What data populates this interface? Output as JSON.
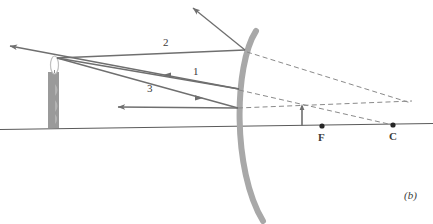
{
  "figure": {
    "panel_label": "(b)",
    "type": "ray-diagram-concave-mirror",
    "colors": {
      "mirror": "#a8a8a8",
      "ray": "#6f6f6f",
      "dashed": "#8a8a8a",
      "axis": "#5a5a5a",
      "candle_body": "#9a9a9a",
      "candle_flame": "#c9c9c9",
      "image_arrow": "#6f6f6f",
      "text": "#3b3b3b"
    },
    "ray_labels": [
      {
        "id": "ray-1",
        "text": "1",
        "x": 193,
        "y": 72
      },
      {
        "id": "ray-2",
        "text": "2",
        "x": 163,
        "y": 43
      },
      {
        "id": "ray-3",
        "text": "3",
        "x": 147,
        "y": 89
      }
    ],
    "point_labels": [
      {
        "id": "focal-point",
        "text": "F",
        "x": 318,
        "y": 132
      },
      {
        "id": "center-of-curvature",
        "text": "C",
        "x": 389,
        "y": 131
      }
    ],
    "points": [
      {
        "id": "F",
        "cx": 322,
        "cy": 126,
        "r": 2.6
      },
      {
        "id": "C",
        "cx": 393,
        "cy": 125,
        "r": 2.6
      }
    ],
    "axis": {
      "x1": 0,
      "y1": 129.5,
      "x2": 433,
      "y2": 123.5
    },
    "mirror": {
      "path": "M 256 31 C 234 65 232 170 263 221",
      "stroke_width": 6
    },
    "object": {
      "name": "candle",
      "body": {
        "x": 48,
        "y": 72,
        "w": 11,
        "h": 56
      },
      "flame_tip": {
        "x": 57,
        "y": 58
      }
    },
    "image": {
      "name": "inverted-image-arrow",
      "x": 302,
      "y_top": 106,
      "y_bottom": 126
    },
    "solid_rays": [
      {
        "id": "incident-ray-2",
        "d": "M 57 58 L 245 50"
      },
      {
        "id": "reflected-ray-2",
        "d": "M 245 50 L 191 6"
      },
      {
        "id": "incident-ray-1",
        "d": "M 57 58 L 239 89"
      },
      {
        "id": "reflected-ray-1",
        "d": "M 239 89 L 58 60"
      },
      {
        "id": "incident-ray-3",
        "d": "M 57 58 L 238 108"
      },
      {
        "id": "reflected-ray-3",
        "d": "M 238 108 L 116 107"
      }
    ],
    "dashed_rays": [
      {
        "id": "virtual-extension-a",
        "d": "M 247 52 L 411 103"
      },
      {
        "id": "virtual-extension-b",
        "d": "M 238 108 L 412 101"
      },
      {
        "id": "virtual-extension-c",
        "d": "M 239 90 L 393 125"
      }
    ],
    "arrowheads": [
      {
        "id": "arrowhead-reflected-2",
        "x": 191,
        "y": 6,
        "angle": 219
      },
      {
        "id": "arrowhead-reflected-1-far",
        "x": 8,
        "y": 45,
        "angle": 189
      },
      {
        "id": "arrowhead-reflected-1-mid",
        "x": 163,
        "y": 75,
        "angle": 189
      },
      {
        "id": "arrowhead-incident-3",
        "x": 201,
        "y": 98,
        "angle": 15
      },
      {
        "id": "arrowhead-reflected-3",
        "x": 116,
        "y": 107,
        "angle": 180
      }
    ],
    "footer_fragment": "  "
  }
}
